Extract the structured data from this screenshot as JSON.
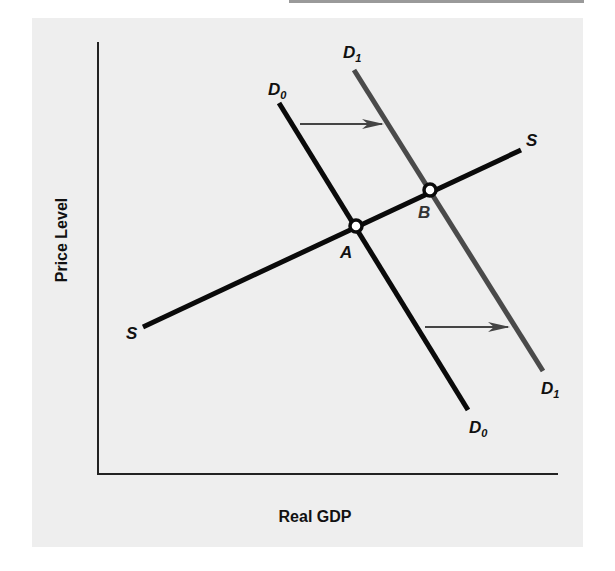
{
  "figure": {
    "x_axis_label": "Real GDP",
    "y_axis_label": "Price Level"
  },
  "curves": {
    "supply": {
      "label": "S"
    },
    "demand_initial": {
      "label": "D",
      "subscript": "0"
    },
    "demand_shifted": {
      "label": "D",
      "subscript": "1"
    }
  },
  "points": {
    "a": {
      "label": "A"
    },
    "b": {
      "label": "B"
    }
  },
  "colors": {
    "panel": "#eeeeee",
    "axis": "#222222",
    "supply": "#0a0a0a",
    "demand_initial": "#0a0a0a",
    "demand_shifted": "#4a4a4a",
    "arrow": "#444444"
  }
}
